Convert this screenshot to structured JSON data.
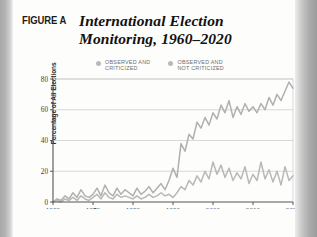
{
  "figure": {
    "label": "FIGURE A",
    "title": "International Election Monitoring, 1960–2020"
  },
  "legend": {
    "position": "top",
    "items": [
      {
        "name": "observed-and-criticized",
        "label": "OBSERVED AND\nCRITICIZED",
        "color": "#b9b9b9"
      },
      {
        "name": "observed-and-not-criticized",
        "label": "OBSERVED AND\nNOT CRITICIZED",
        "color": "#b9b9b9"
      }
    ]
  },
  "colors": {
    "line_upper": "#b0b0b0",
    "line_lower": "#b8b8b8",
    "gridline": "#c8c8c8",
    "axis": "#555555",
    "page": "#fdfdfc",
    "gutter": "#a8a8a8"
  },
  "chart_data": {
    "type": "line",
    "title": "International Election Monitoring, 1960–2020",
    "xlabel": "",
    "ylabel": "Percentage of All Elections",
    "xlim": [
      1960,
      2020
    ],
    "ylim": [
      0,
      80
    ],
    "xticks": [
      1960,
      1970,
      1980,
      1990,
      2000,
      2010,
      2020
    ],
    "yticks": [
      0,
      20,
      40,
      60,
      80
    ],
    "ytick_labels": [
      "0",
      "20",
      "40",
      "60",
      "80"
    ],
    "xtick_labels": [
      "1960",
      "1970",
      "1980",
      "1990",
      "2000",
      "2010",
      "2020"
    ],
    "grid": "horizontal",
    "x": [
      1960,
      1961,
      1962,
      1963,
      1964,
      1965,
      1966,
      1967,
      1968,
      1969,
      1970,
      1971,
      1972,
      1973,
      1974,
      1975,
      1976,
      1977,
      1978,
      1979,
      1980,
      1981,
      1982,
      1983,
      1984,
      1985,
      1986,
      1987,
      1988,
      1989,
      1990,
      1991,
      1992,
      1993,
      1994,
      1995,
      1996,
      1997,
      1998,
      1999,
      2000,
      2001,
      2002,
      2003,
      2004,
      2005,
      2006,
      2007,
      2008,
      2009,
      2010,
      2011,
      2012,
      2013,
      2014,
      2015,
      2016,
      2017,
      2018,
      2019,
      2020
    ],
    "series": [
      {
        "name": "Observed and not criticized",
        "legend_label": "OBSERVED AND NOT CRITICIZED",
        "color": "#b0b0b0",
        "values": [
          0,
          2,
          1,
          4,
          2,
          6,
          3,
          8,
          4,
          3,
          5,
          9,
          4,
          11,
          6,
          4,
          9,
          5,
          8,
          6,
          4,
          9,
          5,
          7,
          10,
          6,
          9,
          12,
          8,
          14,
          22,
          16,
          38,
          33,
          44,
          41,
          52,
          48,
          55,
          50,
          58,
          54,
          63,
          58,
          66,
          55,
          62,
          57,
          64,
          59,
          62,
          58,
          64,
          60,
          68,
          63,
          70,
          66,
          72,
          78,
          74
        ]
      },
      {
        "name": "Observed and criticized",
        "legend_label": "OBSERVED AND CRITICIZED",
        "color": "#b8b8b8",
        "values": [
          0,
          1,
          0,
          2,
          1,
          3,
          1,
          4,
          2,
          1,
          3,
          5,
          2,
          6,
          3,
          2,
          5,
          3,
          4,
          3,
          2,
          4,
          2,
          3,
          5,
          3,
          4,
          6,
          4,
          5,
          3,
          6,
          10,
          8,
          14,
          11,
          17,
          13,
          20,
          15,
          26,
          18,
          24,
          16,
          22,
          14,
          19,
          15,
          23,
          12,
          18,
          14,
          26,
          15,
          21,
          13,
          20,
          11,
          23,
          14,
          17
        ]
      }
    ]
  }
}
